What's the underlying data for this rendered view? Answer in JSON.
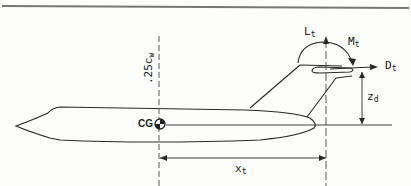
{
  "diagram": {
    "labels": {
      "lift_tail": {
        "main": "L",
        "sub": "t"
      },
      "moment_tail": {
        "main": "M",
        "sub": "t"
      },
      "drag_tail": {
        "main": "D",
        "sub": "t"
      },
      "z_d": {
        "main": "z",
        "sub": "d"
      },
      "x_t": {
        "main": "x",
        "sub": "t"
      },
      "quarter_chord": {
        "main": ".25c",
        "sub": "w"
      },
      "cg": "CG"
    },
    "colors": {
      "line": "#2a2a2a",
      "background": "#fdfdfb"
    }
  }
}
